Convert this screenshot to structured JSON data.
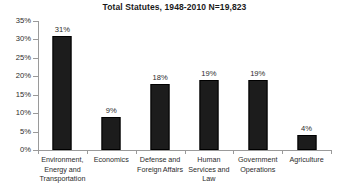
{
  "chart_data": {
    "type": "bar",
    "title": "Total Statutes, 1948-2010 N=19,823",
    "xlabel": "",
    "ylabel": "",
    "ylim": [
      0,
      35
    ],
    "grid": false,
    "legend": null,
    "categories": [
      "Environment, Energy and Transportation",
      "Economics",
      "Defense and Foreign Affairs",
      "Human Services and Law",
      "Government Operations",
      "Agriculture"
    ],
    "values": [
      31,
      9,
      18,
      19,
      19,
      4
    ],
    "data_labels": [
      "31%",
      "9%",
      "18%",
      "19%",
      "19%",
      "4%"
    ],
    "ytick_labels": [
      "0%",
      "5%",
      "10%",
      "15%",
      "20%",
      "25%",
      "30%",
      "35%"
    ],
    "ytick_values": [
      0,
      5,
      10,
      15,
      20,
      25,
      30,
      35
    ],
    "colors": {
      "bar": "#1c1c1c",
      "axis": "#9a9a9a",
      "text": "#2b2b2b",
      "title": "#1a1a1a",
      "background": "#ffffff"
    },
    "category_label_lines": [
      [
        "Environment,",
        "Energy and",
        "Transportation"
      ],
      [
        "Economics"
      ],
      [
        "Defense and",
        "Foreign Affairs"
      ],
      [
        "Human",
        "Services and",
        "Law"
      ],
      [
        "Government",
        "Operations"
      ],
      [
        "Agriculture"
      ]
    ]
  }
}
